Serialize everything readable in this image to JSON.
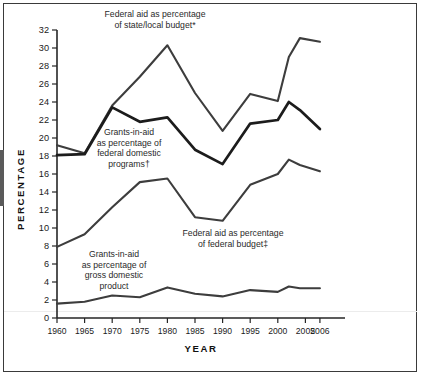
{
  "chart_data": {
    "type": "line",
    "title": "",
    "subtitle": "",
    "xlabel": "YEAR",
    "ylabel": "PERCENTAGE",
    "xlim": [
      1960,
      2006
    ],
    "ylim": [
      0,
      32
    ],
    "grid": false,
    "legend_position": "inline-annotations",
    "x": [
      1960,
      1965,
      1970,
      1975,
      1980,
      1985,
      1990,
      1995,
      2000,
      2002,
      2004,
      2006
    ],
    "xtick_labels": [
      "1960",
      "1965",
      "1970",
      "1975",
      "1980",
      "1985",
      "1990",
      "1995",
      "2000",
      "2005",
      "2006"
    ],
    "ytick_labels": [
      "0",
      "2",
      "4",
      "6",
      "8",
      "10",
      "12",
      "14",
      "16",
      "18",
      "20",
      "22",
      "24",
      "26",
      "28",
      "30",
      "32"
    ],
    "series": [
      {
        "name": "Federal aid as percentage of state/local budget*",
        "values": [
          19.2,
          18.3,
          23.6,
          26.8,
          30.3,
          25.0,
          20.8,
          24.9,
          24.1,
          29.0,
          31.1,
          30.7
        ]
      },
      {
        "name": "Grants-in-aid as percentage of federal domestic programs†",
        "values": [
          18.1,
          18.2,
          23.4,
          21.8,
          22.3,
          18.7,
          17.1,
          21.6,
          22.0,
          24.0,
          23.1,
          21.0
        ]
      },
      {
        "name": "Federal aid as percentage of federal budget‡",
        "values": [
          7.9,
          9.3,
          12.3,
          15.1,
          15.5,
          11.2,
          10.8,
          14.8,
          16.0,
          17.6,
          17.0,
          16.3
        ]
      },
      {
        "name": "Grants-in-aid as percentage of gross domestic product",
        "values": [
          1.6,
          1.8,
          2.5,
          2.3,
          3.4,
          2.7,
          2.4,
          3.1,
          2.9,
          3.5,
          3.3,
          3.3
        ]
      }
    ],
    "annotations": [
      {
        "id": "state-local",
        "text": "Federal aid as percentage\nof state/local budget*"
      },
      {
        "id": "federal-domestic-programs",
        "text": "Grants-in-aid\nas percentage of\nfederal domestic\nprograms†"
      },
      {
        "id": "federal-budget",
        "text": "Federal aid as percentage\nof federal budget‡"
      },
      {
        "id": "gross-domestic-product",
        "text": "Grants-in-aid\nas percentage of\ngross domestic\nproduct"
      }
    ],
    "colors": {
      "line_primary": "#1c1c1c",
      "line_secondary": "#3d3d3d",
      "axis": "#262626",
      "text": "#1b1b1b",
      "frame": "#3a3a3a",
      "background": "#ffffff"
    }
  }
}
